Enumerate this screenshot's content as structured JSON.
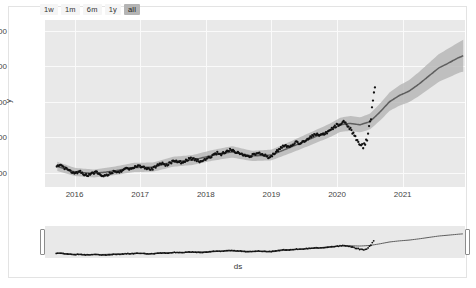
{
  "range_selector": {
    "buttons": [
      {
        "label": "1w",
        "active": false
      },
      {
        "label": "1m",
        "active": false
      },
      {
        "label": "6m",
        "active": false
      },
      {
        "label": "1y",
        "active": false
      },
      {
        "label": "all",
        "active": true
      }
    ]
  },
  "chart_data": {
    "type": "line",
    "title": "",
    "xlabel": "ds",
    "ylabel": "y",
    "grid": true,
    "legend": false,
    "ylim": [
      120,
      1060
    ],
    "xlim": [
      2015.55,
      2021.95
    ],
    "yticks": [
      200,
      400,
      600,
      800,
      1000
    ],
    "xticks": [
      2016,
      2017,
      2018,
      2019,
      2020,
      2021
    ],
    "colors": {
      "observed": "#111111",
      "forecast": "#5e5e5e",
      "interval": "#b0b0b0",
      "plot_background": "#e9e9e9",
      "gridline": "#fafafa",
      "card_background": "#ffffff",
      "button_background": "#f5f5f5",
      "button_active_background": "#b4b4b4"
    },
    "series": [
      {
        "name": "observed",
        "style": "markers",
        "x": [
          2015.72,
          2015.78,
          2015.84,
          2015.9,
          2015.96,
          2016.02,
          2016.08,
          2016.14,
          2016.2,
          2016.26,
          2016.32,
          2016.38,
          2016.44,
          2016.5,
          2016.56,
          2016.62,
          2016.68,
          2016.74,
          2016.8,
          2016.86,
          2016.92,
          2016.98,
          2017.04,
          2017.1,
          2017.16,
          2017.22,
          2017.28,
          2017.34,
          2017.4,
          2017.46,
          2017.52,
          2017.58,
          2017.64,
          2017.7,
          2017.76,
          2017.82,
          2017.88,
          2017.94,
          2018.0,
          2018.06,
          2018.12,
          2018.18,
          2018.24,
          2018.3,
          2018.36,
          2018.42,
          2018.48,
          2018.54,
          2018.6,
          2018.66,
          2018.72,
          2018.78,
          2018.84,
          2018.9,
          2018.96,
          2019.02,
          2019.08,
          2019.14,
          2019.2,
          2019.26,
          2019.32,
          2019.38,
          2019.44,
          2019.5,
          2019.56,
          2019.62,
          2019.68,
          2019.74,
          2019.8,
          2019.86,
          2019.92,
          2019.98,
          2020.04,
          2020.1,
          2020.16,
          2020.22,
          2020.28,
          2020.34,
          2020.4,
          2020.46,
          2020.52,
          2020.58
        ],
        "y": [
          232,
          245,
          228,
          215,
          205,
          198,
          212,
          190,
          186,
          196,
          205,
          192,
          185,
          188,
          200,
          212,
          205,
          218,
          228,
          222,
          235,
          240,
          232,
          225,
          218,
          230,
          245,
          250,
          242,
          255,
          268,
          262,
          258,
          270,
          282,
          275,
          268,
          262,
          275,
          288,
          300,
          312,
          305,
          318,
          330,
          322,
          315,
          308,
          295,
          288,
          300,
          310,
          305,
          298,
          286,
          300,
          320,
          338,
          352,
          345,
          358,
          372,
          365,
          380,
          392,
          405,
          420,
          408,
          415,
          430,
          448,
          462,
          475,
          490,
          470,
          440,
          405,
          372,
          348,
          395,
          520,
          700
        ]
      },
      {
        "name": "forecast",
        "style": "line",
        "x": [
          2015.72,
          2016.0,
          2016.3,
          2016.6,
          2016.9,
          2017.2,
          2017.5,
          2017.8,
          2018.1,
          2018.4,
          2018.7,
          2019.0,
          2019.3,
          2019.6,
          2019.9,
          2020.05,
          2020.2,
          2020.35,
          2020.5,
          2020.65,
          2020.8,
          2020.95,
          2021.1,
          2021.25,
          2021.4,
          2021.55,
          2021.7,
          2021.85,
          2021.93
        ],
        "y": [
          238,
          205,
          196,
          210,
          230,
          232,
          262,
          272,
          298,
          318,
          295,
          300,
          345,
          392,
          440,
          470,
          478,
          470,
          488,
          540,
          600,
          635,
          660,
          700,
          745,
          790,
          818,
          848,
          860
        ],
        "interval_lower": [
          212,
          182,
          174,
          186,
          204,
          206,
          234,
          244,
          268,
          286,
          266,
          270,
          312,
          356,
          402,
          430,
          436,
          428,
          444,
          492,
          548,
          578,
          598,
          632,
          672,
          712,
          736,
          762,
          770
        ],
        "interval_upper": [
          264,
          228,
          218,
          234,
          256,
          258,
          290,
          300,
          328,
          350,
          324,
          330,
          378,
          428,
          478,
          510,
          520,
          512,
          532,
          588,
          652,
          692,
          722,
          768,
          818,
          868,
          900,
          934,
          950
        ]
      }
    ],
    "annotations": [
      "sharp drawdown near 2020.3 followed by steep recovery"
    ]
  },
  "range_slider": {
    "left_handle_label": "range-start-handle",
    "right_handle_label": "range-end-handle",
    "selection_start": 0,
    "selection_end": 100
  }
}
